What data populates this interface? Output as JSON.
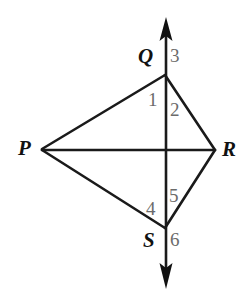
{
  "figure": {
    "type": "geometry-diagram",
    "width": 248,
    "height": 296,
    "background_color": "#ffffff",
    "stroke_color": "#1a1a1a",
    "vertex_label_color": "#111111",
    "angle_label_color": "#6b6b6b"
  },
  "vertices": [
    {
      "id": "P",
      "label": "P",
      "x": 42,
      "y": 149,
      "label_x": 18,
      "label_y": 138
    },
    {
      "id": "Q",
      "label": "Q",
      "x": 165,
      "y": 75,
      "label_x": 138,
      "label_y": 46
    },
    {
      "id": "R",
      "label": "R",
      "x": 215,
      "y": 150,
      "label_x": 222,
      "label_y": 139
    },
    {
      "id": "S",
      "label": "S",
      "x": 165,
      "y": 228,
      "label_x": 143,
      "label_y": 230
    }
  ],
  "angle_labels": [
    {
      "id": "1",
      "label": "1",
      "x": 148,
      "y": 90,
      "at_vertex": "Q",
      "side": "left"
    },
    {
      "id": "2",
      "label": "2",
      "x": 170,
      "y": 100,
      "at_vertex": "Q",
      "side": "right"
    },
    {
      "id": "3",
      "label": "3",
      "x": 170,
      "y": 46,
      "at_vertex": "Q",
      "side": "above-right"
    },
    {
      "id": "4",
      "label": "4",
      "x": 146,
      "y": 199,
      "at_vertex": "S",
      "side": "left"
    },
    {
      "id": "5",
      "label": "5",
      "x": 169,
      "y": 186,
      "at_vertex": "S",
      "side": "right"
    },
    {
      "id": "6",
      "label": "6",
      "x": 170,
      "y": 230,
      "at_vertex": "S",
      "side": "below-right"
    }
  ],
  "segments": [
    {
      "id": "PQ",
      "from": "P",
      "to": "Q"
    },
    {
      "id": "QR",
      "from": "Q",
      "to": "R"
    },
    {
      "id": "RS",
      "from": "R",
      "to": "S"
    },
    {
      "id": "SP",
      "from": "S",
      "to": "P"
    },
    {
      "id": "PR",
      "from": "P",
      "to": "R"
    }
  ],
  "arrow_line": {
    "id": "QS-extended",
    "x": 166,
    "top_y": 18,
    "bottom_y": 288,
    "double_headed": true
  }
}
